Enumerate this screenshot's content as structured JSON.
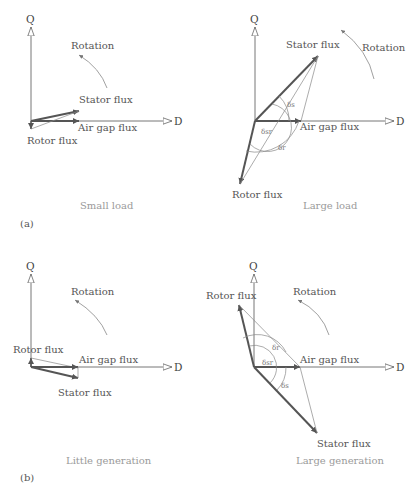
{
  "axes": {
    "q_label": "Q",
    "d_label": "D"
  },
  "labels": {
    "rotation": "Rotation",
    "stator_flux": "Stator flux",
    "rotor_flux": "Rotor flux",
    "air_gap_flux": "Air gap flux"
  },
  "panels": {
    "a": {
      "tag": "(a)",
      "left_caption": "Small load",
      "right_caption": "Large load",
      "angles": {
        "delta_s": "δs",
        "delta_sr": "δsr",
        "delta_r": "δr"
      }
    },
    "b": {
      "tag": "(b)",
      "left_caption": "Little generation",
      "right_caption": "Large generation",
      "angles": {
        "delta_s": "δs",
        "delta_sr": "δsr",
        "delta_r": "δr"
      }
    }
  },
  "colors": {
    "vector": "#555555",
    "thin_line": "#888888",
    "axis": "#666666",
    "caption": "#9a9a9a"
  }
}
